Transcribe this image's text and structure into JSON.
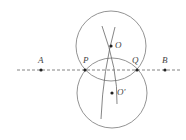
{
  "diagram": {
    "colors": {
      "stroke": "#666666",
      "point": "#222222",
      "label": "#444444",
      "background": "#ffffff"
    },
    "line": {
      "style": "dashed",
      "from": [
        17,
        70
      ],
      "to": [
        181,
        70
      ]
    },
    "points": {
      "A": {
        "label": "A",
        "x": 41,
        "y": 70
      },
      "B": {
        "label": "B",
        "x": 165,
        "y": 70
      },
      "P": {
        "label": "P",
        "x": 85,
        "y": 70
      },
      "Q": {
        "label": "Q",
        "x": 137,
        "y": 70
      },
      "O": {
        "label": "O",
        "x": 111,
        "y": 46
      },
      "O_prime": {
        "label": "O'",
        "x": 112,
        "y": 93
      }
    },
    "circles": [
      {
        "name": "circle-O",
        "cx": 111,
        "cy": 46,
        "r": 35
      },
      {
        "name": "circle-O-prime",
        "cx": 112,
        "cy": 93,
        "r": 35
      }
    ]
  }
}
